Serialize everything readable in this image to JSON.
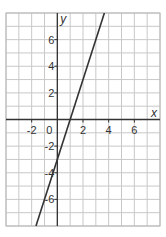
{
  "chart_data": {
    "type": "line",
    "title": "",
    "xlabel": "x",
    "ylabel": "y",
    "xlim": [
      -4,
      8
    ],
    "ylim": [
      -8,
      8
    ],
    "grid": true,
    "x_ticks": [
      -2,
      2,
      4,
      6
    ],
    "y_ticks": [
      -6,
      -4,
      -2,
      2,
      4,
      6
    ],
    "origin_label": "0",
    "series": [
      {
        "name": "y = 3x - 3",
        "slope": 3,
        "intercept": -3,
        "x": [
          -1.667,
          3.667
        ],
        "y": [
          -8,
          8
        ]
      }
    ],
    "colors": {
      "grid": "#c8c8c8",
      "axis": "#333333",
      "line": "#333333"
    }
  },
  "labels": {
    "x_axis": "x",
    "y_axis": "y",
    "origin": "0",
    "xt": [
      "-2",
      "2",
      "4",
      "6"
    ],
    "yt": [
      "6",
      "4",
      "2",
      "-2",
      "-4",
      "-6"
    ]
  }
}
